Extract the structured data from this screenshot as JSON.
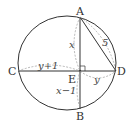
{
  "diagram": {
    "type": "circle-chords",
    "points": {
      "A": {
        "label": "A"
      },
      "B": {
        "label": "B"
      },
      "C": {
        "label": "C"
      },
      "D": {
        "label": "D"
      },
      "E": {
        "label": "E"
      }
    },
    "segment_labels": {
      "AE": "x",
      "EB": "x−1",
      "CE": "y+1",
      "ED": "y",
      "AD": "5"
    },
    "colors": {
      "stroke": "#333333",
      "dashed": "#999999",
      "background": "#ffffff"
    }
  }
}
